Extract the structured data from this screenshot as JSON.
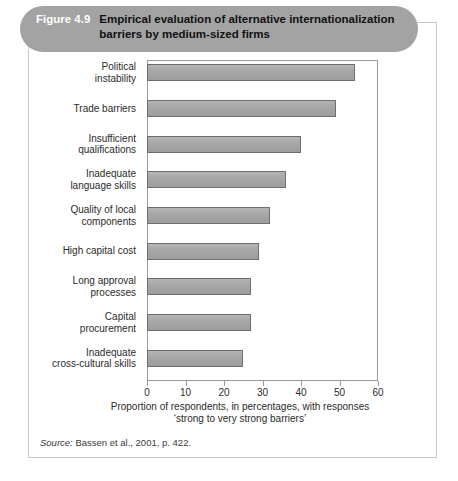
{
  "banner": {
    "figure_number": "Figure 4.9",
    "title_line1": "Empirical evaluation of alternative internationalization",
    "title_line2": "barriers by medium-sized firms",
    "banner_color": "#a3a3a3",
    "number_color": "#ffffff",
    "title_color": "#111111"
  },
  "source": {
    "prefix": "Source:",
    "text": "Bassen et al., 2001, p. 422."
  },
  "chart_data": {
    "type": "bar",
    "orientation": "horizontal",
    "title": "Empirical evaluation of alternative internationalization barriers by medium-sized firms",
    "categories": [
      "Political instability",
      "Trade barriers",
      "Insufficient qualifications",
      "Inadequate language skills",
      "Quality of local components",
      "High capital cost",
      "Long approval processes",
      "Capital procurement",
      "Inadequate cross-cultural skills"
    ],
    "category_lines": [
      [
        "Political",
        "instability"
      ],
      [
        "Trade barriers"
      ],
      [
        "Insufficient",
        "qualifications"
      ],
      [
        "Inadequate",
        "language skills"
      ],
      [
        "Quality of local",
        "components"
      ],
      [
        "High capital cost"
      ],
      [
        "Long approval",
        "processes"
      ],
      [
        "Capital",
        "procurement"
      ],
      [
        "Inadequate",
        "cross-cultural skills"
      ]
    ],
    "values": [
      54,
      49,
      40,
      36,
      32,
      29,
      27,
      27,
      25
    ],
    "xlabel_line1": "Proportion of respondents, in percentages, with responses",
    "xlabel_line2": "‘strong to very strong barriers’",
    "ylabel": "",
    "xlim": [
      0,
      60
    ],
    "xticks": [
      0,
      10,
      20,
      30,
      40,
      50,
      60
    ],
    "xtick_labels": [
      "0",
      "10",
      "20",
      "30",
      "40",
      "50",
      "60"
    ],
    "grid": false,
    "legend": false,
    "bar_color": "#a6a6a6",
    "bar_border_color": "#6f6f6f"
  }
}
